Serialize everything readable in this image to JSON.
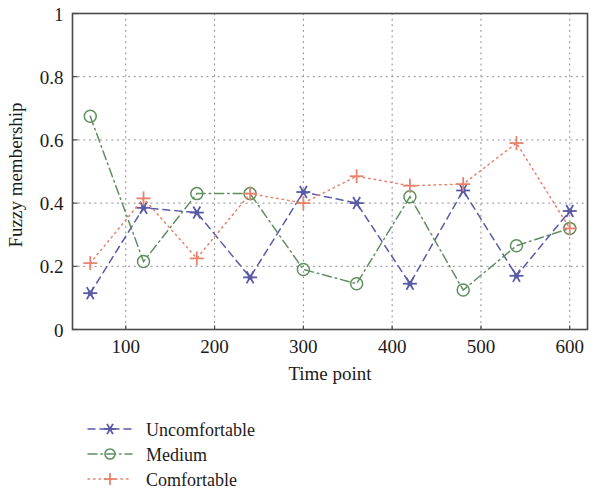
{
  "figure": {
    "kind": "line-chart",
    "background": "#ffffff"
  },
  "axes": {
    "x_title": "Time point",
    "y_title": "Fuzzy membership",
    "x_ticks": [
      "100",
      "200",
      "300",
      "400",
      "500",
      "600"
    ],
    "y_ticks": [
      "0",
      "0.2",
      "0.4",
      "0.6",
      "0.8",
      "1"
    ]
  },
  "legend": {
    "items": [
      {
        "label": "Uncomfortable",
        "color": "#5a5aa6",
        "marker": "star-marker",
        "dash": "7 5"
      },
      {
        "label": "Medium",
        "color": "#5f8f60",
        "marker": "circle-marker",
        "dash": "9 4 1.5 4"
      },
      {
        "label": "Comfortable",
        "color": "#e8826c",
        "marker": "plus-marker",
        "dash": "1.5 4"
      }
    ]
  },
  "chart_data": {
    "type": "line",
    "title": "",
    "xlabel": "Time point",
    "ylabel": "Fuzzy membership",
    "xlim": [
      40,
      620
    ],
    "ylim": [
      0,
      1
    ],
    "xticks": [
      100,
      200,
      300,
      400,
      500,
      600
    ],
    "yticks": [
      0,
      0.2,
      0.4,
      0.6,
      0.8,
      1
    ],
    "grid": true,
    "legend_position": "below-left",
    "x": [
      60,
      120,
      180,
      240,
      300,
      360,
      420,
      480,
      540,
      600
    ],
    "series": [
      {
        "name": "Uncomfortable",
        "color": "#5a5aa6",
        "marker": "star-marker",
        "dash": "7 5",
        "values": [
          0.115,
          0.385,
          0.37,
          0.165,
          0.435,
          0.4,
          0.145,
          0.44,
          0.17,
          0.375
        ]
      },
      {
        "name": "Medium",
        "color": "#5f8f60",
        "marker": "circle-marker",
        "dash": "9 4 1.5 4",
        "values": [
          0.675,
          0.215,
          0.43,
          0.43,
          0.19,
          0.145,
          0.42,
          0.125,
          0.265,
          0.32
        ]
      },
      {
        "name": "Comfortable",
        "color": "#e8826c",
        "marker": "plus-marker",
        "dash": "1.5 4",
        "values": [
          0.21,
          0.415,
          0.225,
          0.43,
          0.4,
          0.485,
          0.455,
          0.46,
          0.59,
          0.32
        ]
      }
    ]
  }
}
